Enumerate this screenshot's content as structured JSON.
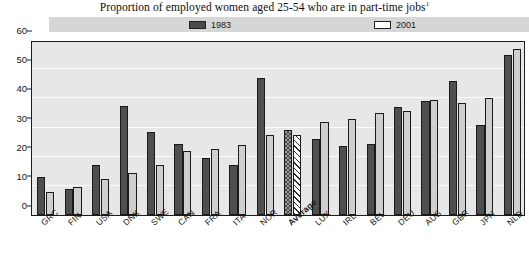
{
  "chart_data": {
    "type": "bar",
    "title": "Proportion of employed women aged 25-54 who are in part-time jobs",
    "title_footnote": "1",
    "xlabel": "",
    "ylabel": "",
    "ylim": [
      0,
      60
    ],
    "yticks": [
      0,
      10,
      20,
      30,
      40,
      50,
      60
    ],
    "grid": true,
    "legend_position": "top",
    "categories": [
      "GRC",
      "FIN",
      "USA",
      "DNK",
      "SWE",
      "CAN",
      "FRA",
      "ITA",
      "NOR",
      "Average",
      "LUX",
      "IRL",
      "BEL",
      "DEU",
      "AUS",
      "GBR",
      "JPN",
      "NLD"
    ],
    "highlight_category": "Average",
    "series": [
      {
        "name": "1983",
        "color": "#4f4f4f",
        "values": [
          13,
          9,
          17,
          37.5,
          28.5,
          24.5,
          19.5,
          17,
          47,
          29,
          26,
          23.5,
          24.5,
          37,
          39,
          46,
          31,
          55
        ]
      },
      {
        "name": "2001",
        "color": "#cfcfcf",
        "values": [
          8,
          9.5,
          12.5,
          14.5,
          17,
          22,
          22.5,
          24,
          27.5,
          27.5,
          32,
          33,
          35,
          35.5,
          39.5,
          38.5,
          40,
          57
        ]
      }
    ]
  },
  "legend": {
    "entries": [
      {
        "label": "1983",
        "swatch": "dark"
      },
      {
        "label": "2001",
        "swatch": "light"
      }
    ]
  },
  "axis": {
    "y_tick_labels": [
      "60",
      "50",
      "40",
      "30",
      "20",
      "10",
      "0"
    ]
  }
}
